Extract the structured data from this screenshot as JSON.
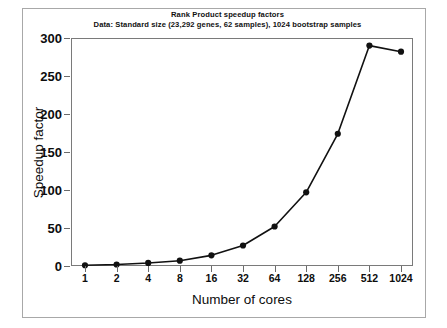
{
  "chart_data": {
    "type": "line",
    "title": "Rank Product speedup factors",
    "subtitle": "Data: Standard size (23,292 genes, 62 samples), 1024 bootstrap samples",
    "xlabel": "Number of cores",
    "ylabel": "Speedup factor",
    "categories": [
      "1",
      "2",
      "4",
      "8",
      "16",
      "32",
      "64",
      "128",
      "256",
      "512",
      "1024"
    ],
    "x": [
      1,
      2,
      4,
      8,
      16,
      32,
      64,
      128,
      256,
      512,
      1024
    ],
    "values": [
      1,
      2,
      4,
      7,
      14,
      27,
      52,
      97,
      174,
      290,
      282
    ],
    "series": [
      {
        "name": "Speedup factor",
        "values": [
          1,
          2,
          4,
          7,
          14,
          27,
          52,
          97,
          174,
          290,
          282
        ]
      }
    ],
    "ylim": [
      0,
      300
    ],
    "yticks": [
      0,
      50,
      100,
      150,
      200,
      250,
      300
    ],
    "ytick_labels": [
      "0",
      "50",
      "100",
      "150",
      "200",
      "250",
      "300"
    ],
    "xtick_labels": [
      "1",
      "2",
      "4",
      "8",
      "16",
      "32",
      "64",
      "128",
      "256",
      "512",
      "1024"
    ],
    "x_scale": "categorical-log2",
    "grid": false,
    "legend": "none",
    "marker": "filled-circle",
    "line_color": "#111111",
    "marker_color": "#111111",
    "axis_color": "#7a7a7a",
    "background_color": "#ffffff"
  }
}
